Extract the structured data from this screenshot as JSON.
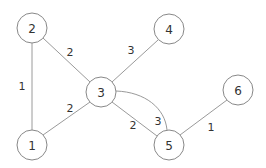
{
  "graph": {
    "nodes": [
      {
        "id": "1",
        "label": "1",
        "x": 32,
        "y": 145
      },
      {
        "id": "2",
        "label": "2",
        "x": 32,
        "y": 28
      },
      {
        "id": "3",
        "label": "3",
        "x": 101,
        "y": 92
      },
      {
        "id": "4",
        "label": "4",
        "x": 169,
        "y": 29
      },
      {
        "id": "5",
        "label": "5",
        "x": 169,
        "y": 145
      },
      {
        "id": "6",
        "label": "6",
        "x": 238,
        "y": 90
      }
    ],
    "edges": [
      {
        "from": "2",
        "to": "1",
        "weight": "1",
        "lx": 22,
        "ly": 86
      },
      {
        "from": "2",
        "to": "3",
        "weight": "2",
        "lx": 70,
        "ly": 52
      },
      {
        "from": "4",
        "to": "3",
        "weight": "3",
        "lx": 131,
        "ly": 50
      },
      {
        "from": "1",
        "to": "3",
        "weight": "2",
        "lx": 70,
        "ly": 108
      },
      {
        "from": "3",
        "to": "5",
        "weight": "3",
        "lx": 158,
        "ly": 121,
        "curved": true
      },
      {
        "from": "3",
        "to": "5",
        "weight": "2",
        "lx": 133,
        "ly": 125
      },
      {
        "from": "5",
        "to": "6",
        "weight": "1",
        "lx": 211,
        "ly": 127
      }
    ]
  }
}
